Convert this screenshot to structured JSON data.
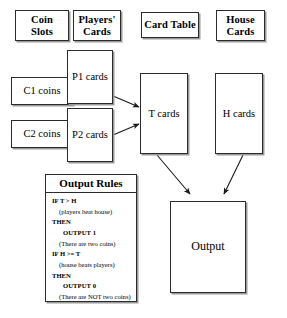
{
  "diagram": {
    "headers": [
      {
        "id": "coin-slots",
        "label": "Coin\nSlots"
      },
      {
        "id": "players-cards",
        "label": "Players'\nCards"
      },
      {
        "id": "card-table",
        "label": "Card Table"
      },
      {
        "id": "house-cards",
        "label": "House\nCards"
      }
    ],
    "nodes": [
      {
        "id": "c1-coins",
        "label": "C1 coins"
      },
      {
        "id": "c2-coins",
        "label": "C2 coins"
      },
      {
        "id": "p1-cards",
        "label": "P1 cards"
      },
      {
        "id": "p2-cards",
        "label": "P2 cards"
      },
      {
        "id": "t-cards",
        "label": "T cards"
      },
      {
        "id": "h-cards",
        "label": "H cards"
      },
      {
        "id": "output",
        "label": "Output"
      }
    ],
    "output_rules": {
      "title": "Output Rules",
      "lines": [
        {
          "text": "IF T > H",
          "style": "kw",
          "indent": 0
        },
        {
          "text": "(players beat house)",
          "style": "note",
          "indent": 1
        },
        {
          "text": "THEN",
          "style": "kw",
          "indent": 0
        },
        {
          "text": "OUTPUT 1",
          "style": "kw",
          "indent": 2
        },
        {
          "text": "(There are two coins)",
          "style": "note",
          "indent": 1
        },
        {
          "text": "IF H >= T",
          "style": "kw",
          "indent": 0
        },
        {
          "text": "(house beats players)",
          "style": "note",
          "indent": 1
        },
        {
          "text": "THEN",
          "style": "kw",
          "indent": 0
        },
        {
          "text": "OUTPUT 0",
          "style": "kw",
          "indent": 2
        },
        {
          "text": "(There are NOT two coins)",
          "style": "note",
          "indent": 1
        }
      ]
    },
    "colors": {
      "stroke": "#2b2b2b",
      "shadow": "#9a9a9a",
      "background": "#ffffff",
      "text": "#000000"
    }
  }
}
